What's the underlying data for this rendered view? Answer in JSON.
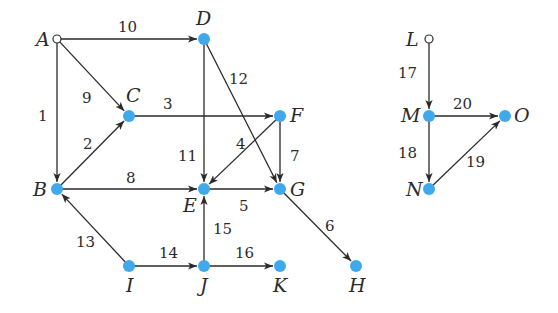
{
  "diagram": {
    "type": "directed-graph",
    "colors": {
      "node": "#3fa9ec",
      "edge": "#2a2a2a",
      "source_node_fill": "#ffffff"
    },
    "nodes": [
      {
        "id": "A",
        "x": 57,
        "y": 39,
        "hollow": true,
        "lx": 36,
        "ly": 46
      },
      {
        "id": "D",
        "x": 204,
        "y": 39,
        "hollow": false,
        "lx": 196,
        "ly": 25
      },
      {
        "id": "C",
        "x": 129,
        "y": 116,
        "hollow": false,
        "lx": 126,
        "ly": 102
      },
      {
        "id": "F",
        "x": 280,
        "y": 116,
        "hollow": false,
        "lx": 290,
        "ly": 122
      },
      {
        "id": "B",
        "x": 57,
        "y": 189,
        "hollow": false,
        "lx": 33,
        "ly": 196
      },
      {
        "id": "E",
        "x": 204,
        "y": 189,
        "hollow": false,
        "lx": 183,
        "ly": 212
      },
      {
        "id": "G",
        "x": 280,
        "y": 189,
        "hollow": false,
        "lx": 290,
        "ly": 196
      },
      {
        "id": "I",
        "x": 129,
        "y": 266,
        "hollow": false,
        "lx": 126,
        "ly": 292
      },
      {
        "id": "J",
        "x": 204,
        "y": 266,
        "hollow": false,
        "lx": 200,
        "ly": 292
      },
      {
        "id": "K",
        "x": 280,
        "y": 266,
        "hollow": false,
        "lx": 273,
        "ly": 292
      },
      {
        "id": "H",
        "x": 356,
        "y": 266,
        "hollow": false,
        "lx": 349,
        "ly": 292
      },
      {
        "id": "L",
        "x": 429,
        "y": 39,
        "hollow": true,
        "lx": 406,
        "ly": 46
      },
      {
        "id": "M",
        "x": 429,
        "y": 116,
        "hollow": false,
        "lx": 401,
        "ly": 122
      },
      {
        "id": "O",
        "x": 505,
        "y": 116,
        "hollow": false,
        "lx": 514,
        "ly": 122
      },
      {
        "id": "N",
        "x": 429,
        "y": 189,
        "hollow": false,
        "lx": 406,
        "ly": 196
      }
    ],
    "edges": [
      {
        "label": "10",
        "from": "A",
        "to": "D",
        "lx": 118,
        "ly": 32
      },
      {
        "label": "9",
        "from": "A",
        "to": "C",
        "lx": 82,
        "ly": 103
      },
      {
        "label": "1",
        "from": "A",
        "to": "B",
        "lx": 38,
        "ly": 121
      },
      {
        "label": "2",
        "from": "B",
        "to": "C",
        "lx": 83,
        "ly": 149
      },
      {
        "label": "3",
        "from": "C",
        "to": "F",
        "lx": 163,
        "ly": 109
      },
      {
        "label": "12",
        "from": "D",
        "to": "G",
        "lx": 229,
        "ly": 84
      },
      {
        "label": "11",
        "from": "D",
        "to": "E",
        "lx": 178,
        "ly": 161
      },
      {
        "label": "4",
        "from": "F",
        "to": "E",
        "lx": 236,
        "ly": 149
      },
      {
        "label": "7",
        "from": "F",
        "to": "G",
        "lx": 290,
        "ly": 161
      },
      {
        "label": "8",
        "from": "B",
        "to": "E",
        "lx": 126,
        "ly": 183
      },
      {
        "label": "5",
        "from": "E",
        "to": "G",
        "lx": 239,
        "ly": 211
      },
      {
        "label": "6",
        "from": "G",
        "to": "H",
        "lx": 325,
        "ly": 231
      },
      {
        "label": "13",
        "from": "I",
        "to": "B",
        "lx": 76,
        "ly": 247
      },
      {
        "label": "14",
        "from": "I",
        "to": "J",
        "lx": 159,
        "ly": 258
      },
      {
        "label": "15",
        "from": "J",
        "to": "E",
        "lx": 213,
        "ly": 234
      },
      {
        "label": "16",
        "from": "J",
        "to": "K",
        "lx": 235,
        "ly": 258
      },
      {
        "label": "17",
        "from": "L",
        "to": "M",
        "lx": 398,
        "ly": 78
      },
      {
        "label": "20",
        "from": "M",
        "to": "O",
        "lx": 453,
        "ly": 109
      },
      {
        "label": "18",
        "from": "M",
        "to": "N",
        "lx": 398,
        "ly": 158
      },
      {
        "label": "19",
        "from": "N",
        "to": "O",
        "lx": 466,
        "ly": 167
      }
    ]
  }
}
